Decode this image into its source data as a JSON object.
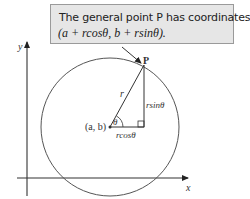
{
  "callout": {
    "line1": "The general point P has coordinates",
    "line2": "(a + rcosθ, b + rsinθ)."
  },
  "labels": {
    "y_axis": "y",
    "x_axis": "x",
    "point_p": "P",
    "radius": "r",
    "center": "(a, b)",
    "angle": "θ",
    "vertical_leg": "rsinθ",
    "horizontal_leg": "rcosθ"
  }
}
